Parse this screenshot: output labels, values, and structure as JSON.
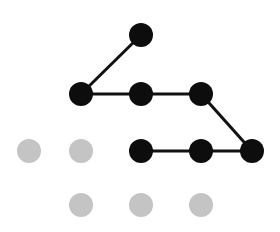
{
  "diagram": {
    "type": "dot-path",
    "background": "#ffffff",
    "colors": {
      "active": "#0d0d0d",
      "inactive": "#c4c4c4",
      "edge": "#111111"
    },
    "node_radius": 12,
    "nodes": [
      {
        "id": "n1",
        "x": 141,
        "y": 35,
        "state": "active"
      },
      {
        "id": "n2",
        "x": 81,
        "y": 94,
        "state": "active"
      },
      {
        "id": "n3",
        "x": 141,
        "y": 94,
        "state": "active"
      },
      {
        "id": "n4",
        "x": 201,
        "y": 94,
        "state": "active"
      },
      {
        "id": "n5",
        "x": 252,
        "y": 151,
        "state": "active"
      },
      {
        "id": "n6",
        "x": 201,
        "y": 151,
        "state": "active"
      },
      {
        "id": "n7",
        "x": 141,
        "y": 151,
        "state": "active"
      },
      {
        "id": "g1",
        "x": 29,
        "y": 151,
        "state": "inactive"
      },
      {
        "id": "g2",
        "x": 81,
        "y": 151,
        "state": "inactive"
      },
      {
        "id": "g3",
        "x": 81,
        "y": 205,
        "state": "inactive"
      },
      {
        "id": "g4",
        "x": 141,
        "y": 205,
        "state": "inactive"
      },
      {
        "id": "g5",
        "x": 201,
        "y": 205,
        "state": "inactive"
      }
    ],
    "path": [
      "n1",
      "n2",
      "n3",
      "n4",
      "n5",
      "n6",
      "n7"
    ]
  }
}
